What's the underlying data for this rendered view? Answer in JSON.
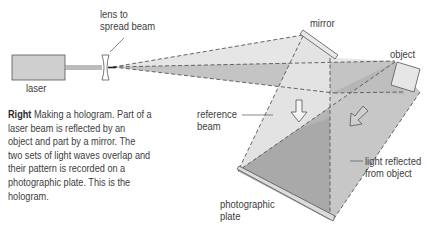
{
  "labels": {
    "laser": "laser",
    "lens_line1": "lens to",
    "lens_line2": "spread beam",
    "mirror": "mirror",
    "object": "object",
    "reference_line1": "reference",
    "reference_line2": "beam",
    "reflected_line1": "light reflected",
    "reflected_line2": "from object",
    "plate_line1": "photographic",
    "plate_line2": "plate"
  },
  "caption": {
    "lead": "Right",
    "text": " Making a hologram. Part of a laser beam is reflected by an object and part by a mirror. The two sets of light waves overlap and their pattern is recorded on a photographic plate. This is the hologram."
  },
  "colors": {
    "light_beam": "#e4e4e4",
    "mid_beam": "#c6c6c6",
    "dark_overlap": "#a9a9a9",
    "laser_body": "#cfcfcf",
    "outline": "#555555"
  }
}
